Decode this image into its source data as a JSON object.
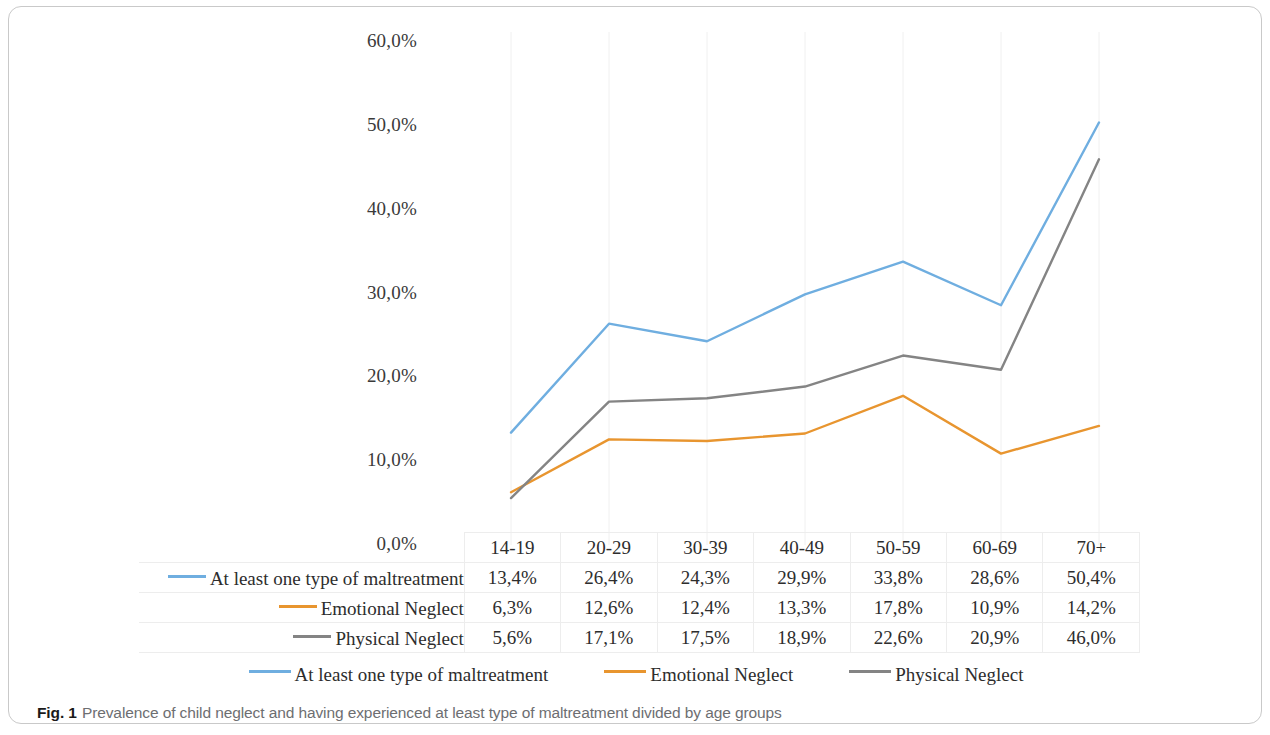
{
  "figure": {
    "caption_label": "Fig. 1",
    "caption_text": "Prevalence of child neglect and having experienced at least type of maltreatment divided by age groups"
  },
  "colors": {
    "series_blue": "#6FAEE0",
    "series_orange": "#E8952F",
    "series_gray": "#848484",
    "gridline": "#F0F0F0",
    "table_border": "#EDEDED",
    "axis_text": "#3A3A3A",
    "caption_text": "#6D6E71"
  },
  "chart_data": {
    "type": "line",
    "title": "",
    "xlabel": "",
    "ylabel": "",
    "categories": [
      "14-19",
      "20-29",
      "30-39",
      "40-49",
      "50-59",
      "60-69",
      "70+"
    ],
    "ylim": [
      0,
      60
    ],
    "yticks": [
      0,
      10,
      20,
      30,
      40,
      50,
      60
    ],
    "ytick_labels": [
      "0,0%",
      "10,0%",
      "20,0%",
      "30,0%",
      "40,0%",
      "50,0%",
      "60,0%"
    ],
    "grid": "vertical-only",
    "legend_position": "bottom",
    "value_suffix": "%",
    "series": [
      {
        "name": "At least one type of maltreatment",
        "color": "#6FAEE0",
        "values": [
          13.4,
          26.4,
          24.3,
          29.9,
          33.8,
          28.6,
          50.4
        ],
        "labels": [
          "13,4%",
          "26,4%",
          "24,3%",
          "29,9%",
          "33,8%",
          "28,6%",
          "50,4%"
        ]
      },
      {
        "name": "Emotional Neglect",
        "color": "#E8952F",
        "values": [
          6.3,
          12.6,
          12.4,
          13.3,
          17.8,
          10.9,
          14.2
        ],
        "labels": [
          "6,3%",
          "12,6%",
          "12,4%",
          "13,3%",
          "17,8%",
          "10,9%",
          "14,2%"
        ]
      },
      {
        "name": "Physical Neglect",
        "color": "#848484",
        "values": [
          5.6,
          17.1,
          17.5,
          18.9,
          22.6,
          20.9,
          46.0
        ],
        "labels": [
          "5,6%",
          "17,1%",
          "17,5%",
          "18,9%",
          "22,6%",
          "20,9%",
          "46,0%"
        ]
      }
    ]
  },
  "data_table": {
    "corner_label": "",
    "column_headers": [
      "14-19",
      "20-29",
      "30-39",
      "40-49",
      "50-59",
      "60-69",
      "70+"
    ],
    "rows": [
      {
        "label": "At least one type of maltreatment",
        "color": "#6FAEE0",
        "values": [
          "13,4%",
          "26,4%",
          "24,3%",
          "29,9%",
          "33,8%",
          "28,6%",
          "50,4%"
        ]
      },
      {
        "label": "Emotional Neglect",
        "color": "#E8952F",
        "values": [
          "6,3%",
          "12,6%",
          "12,4%",
          "13,3%",
          "17,8%",
          "10,9%",
          "14,2%"
        ]
      },
      {
        "label": "Physical Neglect",
        "color": "#848484",
        "values": [
          "5,6%",
          "17,1%",
          "17,5%",
          "18,9%",
          "22,6%",
          "20,9%",
          "46,0%"
        ]
      }
    ]
  },
  "legend": {
    "items": [
      {
        "label": "At least one type of maltreatment",
        "color": "#6FAEE0"
      },
      {
        "label": "Emotional Neglect",
        "color": "#E8952F"
      },
      {
        "label": "Physical Neglect",
        "color": "#848484"
      }
    ]
  }
}
